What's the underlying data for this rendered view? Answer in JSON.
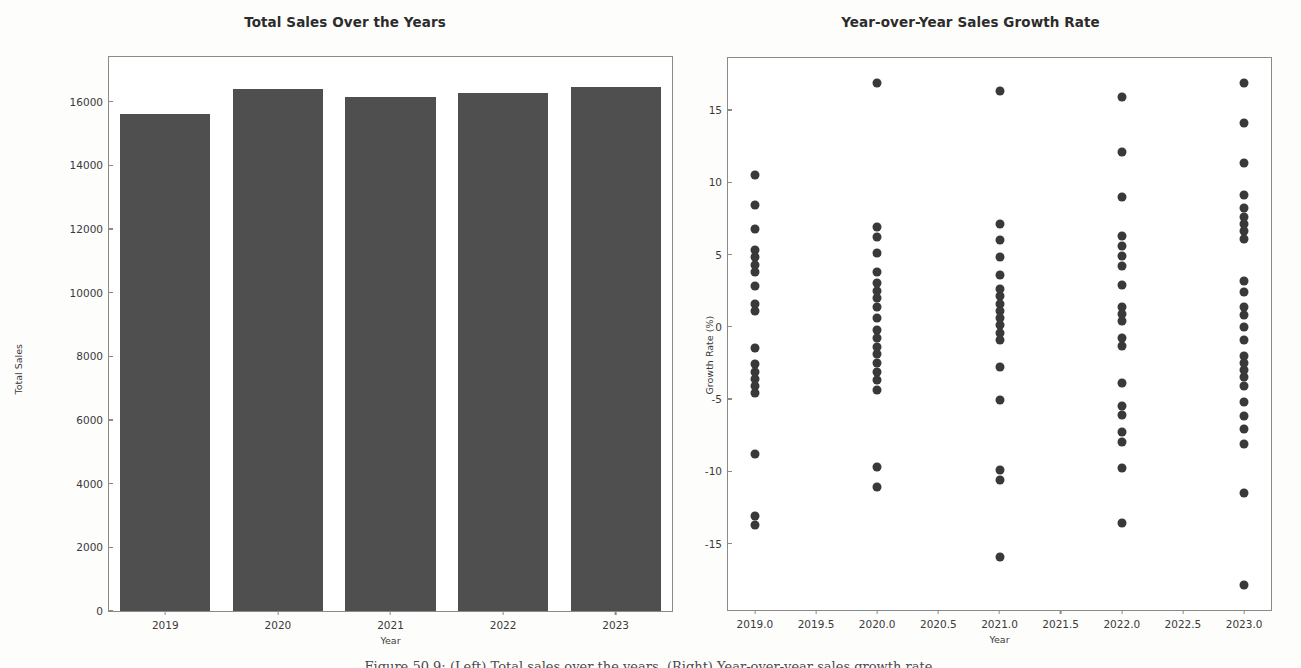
{
  "figure": {
    "caption": "Figure 50.9: (Left) Total sales over the years. (Right) Year-over-year sales growth rate."
  },
  "chart_data": [
    {
      "id": "total-sales",
      "type": "bar",
      "title": "Total Sales Over the Years",
      "xlabel": "Year",
      "ylabel": "Total Sales",
      "categories": [
        "2019",
        "2020",
        "2021",
        "2022",
        "2023"
      ],
      "values": [
        15600,
        16380,
        16140,
        16270,
        16460
      ],
      "ylim": [
        0,
        17400
      ],
      "yticks": [
        0,
        2000,
        4000,
        6000,
        8000,
        10000,
        12000,
        14000,
        16000
      ],
      "ytick_labels": [
        "0",
        "2000",
        "4000",
        "6000",
        "8000",
        "10000",
        "12000",
        "14000",
        "16000"
      ],
      "bar_color": "#4f4f4f",
      "grid": false,
      "legend": "none"
    },
    {
      "id": "growth-rate",
      "type": "scatter",
      "title": "Year-over-Year Sales Growth Rate",
      "xlabel": "Year",
      "ylabel": "Growth Rate (%)",
      "xlim": [
        2018.78,
        2023.22
      ],
      "ylim": [
        -19.6,
        18.6
      ],
      "xticks": [
        2019.0,
        2019.5,
        2020.0,
        2020.5,
        2021.0,
        2021.5,
        2022.0,
        2022.5,
        2023.0
      ],
      "xtick_labels": [
        "2019.0",
        "2019.5",
        "2020.0",
        "2020.5",
        "2021.0",
        "2021.5",
        "2022.0",
        "2022.5",
        "2023.0"
      ],
      "yticks": [
        15,
        10,
        5,
        0,
        -5,
        -10,
        -15
      ],
      "ytick_labels": [
        "15",
        "10",
        "5",
        "0",
        "-5",
        "-10",
        "-15"
      ],
      "point_color": "#393939",
      "grid": false,
      "legend": "none",
      "series": [
        {
          "name": "2019",
          "x": 2019.0,
          "values": [
            10.5,
            8.4,
            6.8,
            5.3,
            4.8,
            4.3,
            3.8,
            2.8,
            1.6,
            1.1,
            -1.5,
            -2.6,
            -3.1,
            -3.6,
            -4.1,
            -4.6,
            -8.8,
            -13.1,
            -13.7
          ]
        },
        {
          "name": "2020",
          "x": 2020.0,
          "values": [
            16.9,
            6.9,
            6.2,
            5.1,
            3.8,
            3.0,
            2.5,
            2.0,
            1.4,
            0.6,
            -0.2,
            -0.8,
            -1.4,
            -1.9,
            -2.5,
            -3.1,
            -3.7,
            -4.4,
            -9.7,
            -11.1
          ]
        },
        {
          "name": "2021",
          "x": 2021.0,
          "values": [
            16.3,
            7.1,
            6.0,
            4.8,
            3.6,
            2.6,
            2.1,
            1.6,
            1.1,
            0.6,
            0.1,
            -0.4,
            -0.9,
            -2.8,
            -5.1,
            -9.9,
            -10.6,
            -15.9
          ]
        },
        {
          "name": "2022",
          "x": 2022.0,
          "values": [
            15.9,
            12.1,
            9.0,
            6.3,
            5.6,
            4.9,
            4.2,
            2.9,
            1.4,
            0.9,
            0.4,
            -0.8,
            -1.3,
            -3.9,
            -5.5,
            -6.1,
            -7.3,
            -8.0,
            -9.8,
            -13.6
          ]
        },
        {
          "name": "2023",
          "x": 2023.0,
          "values": [
            16.9,
            14.1,
            11.3,
            9.1,
            8.2,
            7.6,
            7.1,
            6.6,
            6.1,
            3.2,
            2.4,
            1.4,
            0.8,
            0.0,
            -0.9,
            -2.0,
            -2.5,
            -3.0,
            -3.5,
            -4.1,
            -5.2,
            -6.2,
            -7.1,
            -8.1,
            -11.5,
            -17.9
          ]
        }
      ]
    }
  ]
}
